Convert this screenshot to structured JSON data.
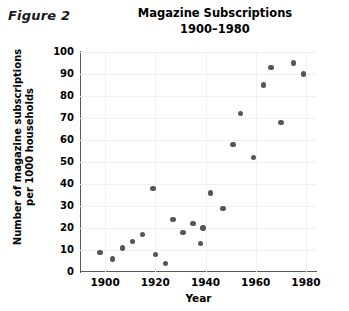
{
  "figure": {
    "label": "Figure 2"
  },
  "chart_data": {
    "type": "scatter",
    "title": "Magazine Subscriptions",
    "subtitle": "1900–1980",
    "xlabel": "Year",
    "ylabel": "Number of magazine subscriptions per 1000 households",
    "ylabel_line1": "Number of magazine subscriptions",
    "ylabel_line2": "per 1000 households",
    "xlim": [
      1890,
      1984
    ],
    "ylim": [
      0,
      100
    ],
    "xticks": [
      1900,
      1920,
      1940,
      1960,
      1980
    ],
    "yticks": [
      0,
      10,
      20,
      30,
      40,
      50,
      60,
      70,
      80,
      90,
      100
    ],
    "grid": true,
    "legend": null,
    "marker_color": "#545659",
    "points": [
      {
        "x": 1898,
        "y": 9
      },
      {
        "x": 1903,
        "y": 6
      },
      {
        "x": 1907,
        "y": 11
      },
      {
        "x": 1911,
        "y": 14
      },
      {
        "x": 1915,
        "y": 17
      },
      {
        "x": 1919,
        "y": 38
      },
      {
        "x": 1920,
        "y": 8
      },
      {
        "x": 1924,
        "y": 4
      },
      {
        "x": 1927,
        "y": 24
      },
      {
        "x": 1931,
        "y": 18
      },
      {
        "x": 1935,
        "y": 22
      },
      {
        "x": 1938,
        "y": 13
      },
      {
        "x": 1939,
        "y": 20
      },
      {
        "x": 1942,
        "y": 36
      },
      {
        "x": 1947,
        "y": 29
      },
      {
        "x": 1951,
        "y": 58
      },
      {
        "x": 1954,
        "y": 72
      },
      {
        "x": 1959,
        "y": 52
      },
      {
        "x": 1963,
        "y": 85
      },
      {
        "x": 1966,
        "y": 93
      },
      {
        "x": 1970,
        "y": 68
      },
      {
        "x": 1975,
        "y": 95
      },
      {
        "x": 1979,
        "y": 90
      }
    ]
  }
}
